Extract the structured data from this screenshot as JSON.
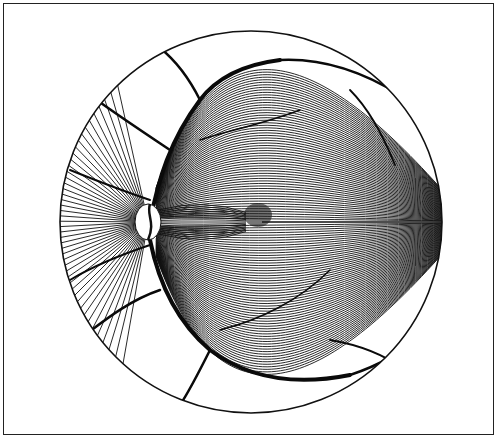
{
  "figure": {
    "style": "black ink line drawing",
    "elements": [
      "fundus-circle",
      "optic-disc",
      "fovea",
      "nerve-fiber-lines",
      "blood-vessels",
      "horizontal-raphe"
    ],
    "colors": {
      "ink": "#111111",
      "background": "#ffffff",
      "frame": "#222222"
    }
  }
}
